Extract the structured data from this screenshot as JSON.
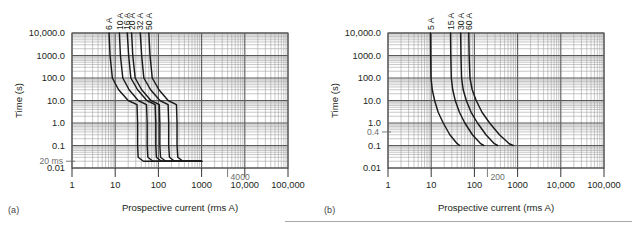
{
  "figure": {
    "background": "#ffffff",
    "ink": "#231f20",
    "grid_major_color": "#5a5a5a",
    "grid_minor_color": "#9a9a9a",
    "curve_color": "#1a1a1a",
    "annotation_color": "#6d6d6d",
    "divider_color": "#a8a8a8"
  },
  "panels": [
    {
      "tag": "(a)",
      "chart_data": {
        "type": "line",
        "title": "",
        "xlabel": "Prospective current (rms A)",
        "ylabel": "Time (s)",
        "xscale": "log",
        "yscale": "log",
        "xlim": [
          1,
          100000
        ],
        "ylim": [
          0.01,
          10000
        ],
        "grid": "log-log major and minor",
        "legend": "curve end labels at top of plot",
        "xticks": [
          "1",
          "10",
          "100",
          "1000",
          "10,000",
          "100,000"
        ],
        "xtick_values": [
          1,
          10,
          100,
          1000,
          10000,
          100000
        ],
        "yticks": [
          "0.01",
          "0.1",
          "1.0",
          "10.0",
          "100.0",
          "1000.0",
          "10,000.0"
        ],
        "ytick_values": [
          0.01,
          0.1,
          1,
          10,
          100,
          1000,
          10000
        ],
        "annotations": [
          {
            "text": "20 ms",
            "x": 1,
            "y": 0.02,
            "note": "instantaneous trip floor"
          },
          {
            "text": "4000",
            "x": 4000,
            "y": 0.01,
            "note": "prospective current marker"
          }
        ],
        "series": [
          {
            "name": "6 A",
            "label": "6 A",
            "rating_a": 6,
            "points": [
              {
                "i": 7.2,
                "t": 10000
              },
              {
                "i": 7.6,
                "t": 1000
              },
              {
                "i": 8.6,
                "t": 100
              },
              {
                "i": 12,
                "t": 30
              },
              {
                "i": 20,
                "t": 10
              },
              {
                "i": 32,
                "t": 6.5
              },
              {
                "i": 33,
                "t": 1.0
              },
              {
                "i": 33,
                "t": 0.1
              },
              {
                "i": 34,
                "t": 0.03
              },
              {
                "i": 45,
                "t": 0.02
              },
              {
                "i": 1000,
                "t": 0.02
              }
            ]
          },
          {
            "name": "10 A",
            "label": "10 A",
            "rating_a": 10,
            "points": [
              {
                "i": 12.5,
                "t": 10000
              },
              {
                "i": 13.2,
                "t": 1000
              },
              {
                "i": 15,
                "t": 100
              },
              {
                "i": 21,
                "t": 30
              },
              {
                "i": 34,
                "t": 10
              },
              {
                "i": 53,
                "t": 6.5
              },
              {
                "i": 55,
                "t": 1.0
              },
              {
                "i": 55,
                "t": 0.1
              },
              {
                "i": 57,
                "t": 0.03
              },
              {
                "i": 75,
                "t": 0.02
              },
              {
                "i": 1000,
                "t": 0.02
              }
            ]
          },
          {
            "name": "16 A",
            "label": "16 A",
            "rating_a": 16,
            "points": [
              {
                "i": 19,
                "t": 10000
              },
              {
                "i": 20.5,
                "t": 1000
              },
              {
                "i": 23,
                "t": 100
              },
              {
                "i": 33,
                "t": 30
              },
              {
                "i": 54,
                "t": 10
              },
              {
                "i": 84,
                "t": 6.5
              },
              {
                "i": 87,
                "t": 1.0
              },
              {
                "i": 87,
                "t": 0.1
              },
              {
                "i": 90,
                "t": 0.03
              },
              {
                "i": 118,
                "t": 0.02
              },
              {
                "i": 1000,
                "t": 0.02
              }
            ]
          },
          {
            "name": "20 A",
            "label": "20 A",
            "rating_a": 20,
            "points": [
              {
                "i": 24,
                "t": 10000
              },
              {
                "i": 25.5,
                "t": 1000
              },
              {
                "i": 29,
                "t": 100
              },
              {
                "i": 41,
                "t": 30
              },
              {
                "i": 67,
                "t": 10
              },
              {
                "i": 105,
                "t": 6.5
              },
              {
                "i": 108,
                "t": 1.0
              },
              {
                "i": 108,
                "t": 0.1
              },
              {
                "i": 112,
                "t": 0.03
              },
              {
                "i": 148,
                "t": 0.02
              },
              {
                "i": 1000,
                "t": 0.02
              }
            ]
          },
          {
            "name": "32 A",
            "label": "32 A",
            "rating_a": 32,
            "points": [
              {
                "i": 38,
                "t": 10000
              },
              {
                "i": 41,
                "t": 1000
              },
              {
                "i": 46,
                "t": 100
              },
              {
                "i": 66,
                "t": 30
              },
              {
                "i": 108,
                "t": 10
              },
              {
                "i": 168,
                "t": 6.5
              },
              {
                "i": 173,
                "t": 1.0
              },
              {
                "i": 173,
                "t": 0.1
              },
              {
                "i": 180,
                "t": 0.03
              },
              {
                "i": 237,
                "t": 0.02
              },
              {
                "i": 1000,
                "t": 0.02
              }
            ]
          },
          {
            "name": "50 A",
            "label": "50 A",
            "rating_a": 50,
            "points": [
              {
                "i": 60,
                "t": 10000
              },
              {
                "i": 64,
                "t": 1000
              },
              {
                "i": 72,
                "t": 100
              },
              {
                "i": 103,
                "t": 30
              },
              {
                "i": 168,
                "t": 10
              },
              {
                "i": 262,
                "t": 6.5
              },
              {
                "i": 270,
                "t": 1.0
              },
              {
                "i": 270,
                "t": 0.1
              },
              {
                "i": 281,
                "t": 0.03
              },
              {
                "i": 370,
                "t": 0.02
              },
              {
                "i": 1000,
                "t": 0.02
              }
            ]
          }
        ]
      }
    },
    {
      "tag": "(b)",
      "chart_data": {
        "type": "line",
        "title": "",
        "xlabel": "Prospective current (rms A)",
        "ylabel": "Time (s)",
        "xscale": "log",
        "yscale": "log",
        "xlim": [
          1,
          100000
        ],
        "ylim": [
          0.01,
          10000
        ],
        "grid": "log-log major and minor",
        "legend": "curve end labels at top of plot",
        "xticks": [
          "1",
          "10",
          "100",
          "1000",
          "10,000",
          "100,000"
        ],
        "xtick_values": [
          1,
          10,
          100,
          1000,
          10000,
          100000
        ],
        "yticks": [
          "0.01",
          "0.1",
          "1.0",
          "10.0",
          "100.0",
          "1000.0",
          "10,000.0"
        ],
        "ytick_values": [
          0.01,
          0.1,
          1,
          10,
          100,
          1000,
          10000
        ],
        "annotations": [
          {
            "text": "0.4",
            "x": 1,
            "y": 0.4,
            "note": "disconnection time marker"
          },
          {
            "text": "200",
            "x": 200,
            "y": 0.01,
            "note": "prospective current marker"
          }
        ],
        "series": [
          {
            "name": "5 A",
            "label": "5 A",
            "rating_a": 5,
            "points": [
              {
                "i": 9.6,
                "t": 10000
              },
              {
                "i": 9.7,
                "t": 1000
              },
              {
                "i": 9.9,
                "t": 100
              },
              {
                "i": 10.6,
                "t": 30
              },
              {
                "i": 12.0,
                "t": 10
              },
              {
                "i": 14.5,
                "t": 3
              },
              {
                "i": 19,
                "t": 1.0
              },
              {
                "i": 27,
                "t": 0.3
              },
              {
                "i": 40,
                "t": 0.12
              },
              {
                "i": 46,
                "t": 0.1
              }
            ]
          },
          {
            "name": "15 A",
            "label": "15 A",
            "rating_a": 15,
            "points": [
              {
                "i": 28,
                "t": 10000
              },
              {
                "i": 28.4,
                "t": 1000
              },
              {
                "i": 29.2,
                "t": 100
              },
              {
                "i": 31.5,
                "t": 30
              },
              {
                "i": 36,
                "t": 10
              },
              {
                "i": 45,
                "t": 3
              },
              {
                "i": 60,
                "t": 1.0
              },
              {
                "i": 90,
                "t": 0.3
              },
              {
                "i": 140,
                "t": 0.12
              },
              {
                "i": 165,
                "t": 0.1
              }
            ]
          },
          {
            "name": "30 A",
            "label": "30 A",
            "rating_a": 30,
            "points": [
              {
                "i": 48,
                "t": 10000
              },
              {
                "i": 48.8,
                "t": 1000
              },
              {
                "i": 50.5,
                "t": 100
              },
              {
                "i": 55,
                "t": 30
              },
              {
                "i": 65,
                "t": 10
              },
              {
                "i": 84,
                "t": 3
              },
              {
                "i": 118,
                "t": 1.0
              },
              {
                "i": 185,
                "t": 0.3
              },
              {
                "i": 290,
                "t": 0.12
              },
              {
                "i": 345,
                "t": 0.1
              }
            ]
          },
          {
            "name": "60 A",
            "label": "60 A",
            "rating_a": 60,
            "points": [
              {
                "i": 74,
                "t": 10000
              },
              {
                "i": 75.5,
                "t": 1000
              },
              {
                "i": 79,
                "t": 100
              },
              {
                "i": 89,
                "t": 30
              },
              {
                "i": 110,
                "t": 10
              },
              {
                "i": 150,
                "t": 3
              },
              {
                "i": 225,
                "t": 1.0
              },
              {
                "i": 380,
                "t": 0.3
              },
              {
                "i": 640,
                "t": 0.12
              },
              {
                "i": 790,
                "t": 0.1
              }
            ]
          }
        ]
      }
    }
  ]
}
